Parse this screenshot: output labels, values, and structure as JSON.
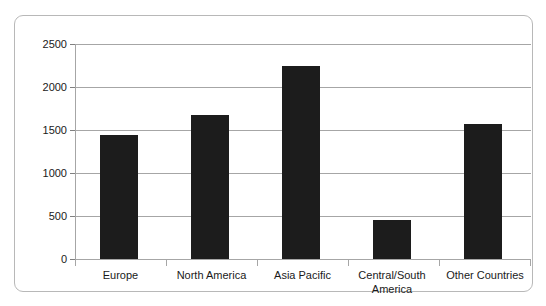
{
  "chart_data": {
    "type": "bar",
    "title": "",
    "subtitle": "",
    "xlabel": "",
    "ylabel": "",
    "categories": [
      "Europe",
      "North America",
      "Asia Pacific",
      "Central/South America",
      "Other Countries"
    ],
    "values": [
      1440,
      1670,
      2240,
      450,
      1570
    ],
    "series": [
      {
        "name": "",
        "values": [
          1440,
          1670,
          2240,
          450,
          1570
        ]
      }
    ],
    "ylim": [
      0,
      2500
    ],
    "ytick_labels": [
      "0",
      "500",
      "1000",
      "1500",
      "2000",
      "2500"
    ],
    "ytick_values": [
      0,
      500,
      1000,
      1500,
      2000,
      2500
    ],
    "grid": true,
    "legend": false,
    "legend_position": "none",
    "bar_color": "#1c1c1c",
    "gridline_color": "#a6a6a6",
    "axis_color": "#a6a6a6",
    "frame_color": "#b8b8b8",
    "background_color": "#ffffff",
    "annotations": []
  }
}
